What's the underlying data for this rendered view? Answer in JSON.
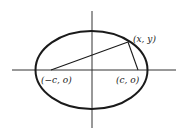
{
  "diagram": {
    "type": "ellipse-foci",
    "colors": {
      "stroke": "#1a1a1a",
      "axis": "#333333",
      "background": "#ffffff"
    },
    "axes": {
      "horizontal": {
        "x1": 12,
        "x2": 176,
        "y": 70
      },
      "vertical": {
        "x": 92,
        "y1": 11,
        "y2": 128
      }
    },
    "ellipse": {
      "cx": 91.5,
      "cy": 70,
      "rx": 56,
      "ry": 39
    },
    "points": {
      "point_on_ellipse": {
        "label": "(x, y)",
        "px": 128,
        "py": 42
      },
      "left_focus": {
        "label": "(−c, o)",
        "px": 51,
        "py": 70
      },
      "right_focus": {
        "label": "(c, o)",
        "px": 138,
        "py": 70
      }
    },
    "labels": {
      "point": "(x, y)",
      "left_focus": "(−c, o)",
      "right_focus": "(c, o)"
    }
  }
}
